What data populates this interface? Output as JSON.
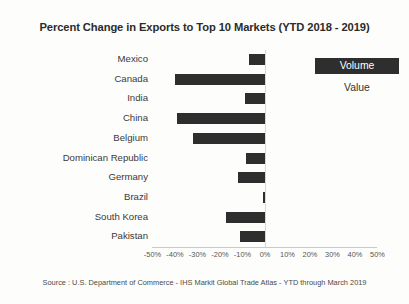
{
  "chart": {
    "title": "Percent Change in Exports to Top 10  Markets (YTD 2018  - 2019)",
    "source_note": "Source : U.S. Department of Commerce - IHS Markit Global Trade Atlas - YTD through March 2019"
  },
  "legend": {
    "position": "right",
    "items": [
      {
        "label": "Volume",
        "selected": true
      },
      {
        "label": "Value",
        "selected": false
      }
    ]
  },
  "chart_data": {
    "type": "bar",
    "orientation": "horizontal",
    "title": "Percent Change in Exports to Top 10  Markets (YTD 2018  - 2019)",
    "xlabel": "",
    "ylabel": "",
    "xlim": [
      -50,
      50
    ],
    "grid": false,
    "legend_position": "right",
    "series_name": "Volume",
    "bar_color": "#2e2e2e",
    "categories": [
      "Mexico",
      "Canada",
      "India",
      "China",
      "Belgium",
      "Dominican Republic",
      "Germany",
      "Brazil",
      "South Korea",
      "Pakistan"
    ],
    "values": [
      -7,
      -40,
      -9,
      -39,
      -32,
      -8.5,
      -12,
      -1,
      -17.5,
      -11
    ],
    "xticks": [
      -50,
      -40,
      -30,
      -20,
      -10,
      0,
      10,
      20,
      30,
      40,
      50
    ],
    "xticklabels": [
      "-50%",
      "-40%",
      "-30%",
      "-20%",
      "-10%",
      "0%",
      "10%",
      "20%",
      "30%",
      "40%",
      "50%"
    ]
  }
}
